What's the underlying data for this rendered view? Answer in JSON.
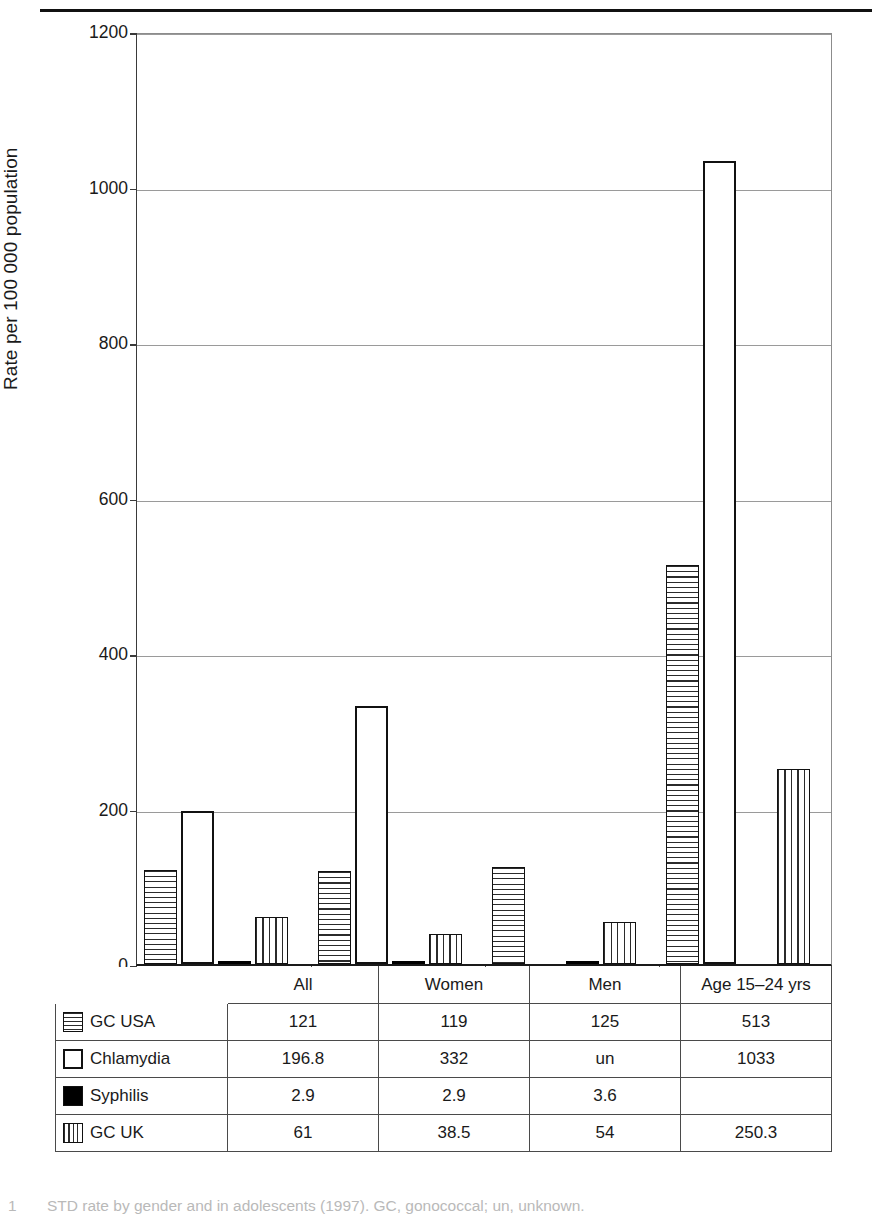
{
  "figure": {
    "y_axis_title": "Rate per 100 000 population",
    "caption_number": "1",
    "caption_text": "STD rate by gender and in adolescents (1997). GC, gonococcal; un, unknown."
  },
  "chart_data": {
    "type": "bar",
    "title": "",
    "xlabel": "",
    "ylabel": "Rate per 100 000 population",
    "ylim": [
      0,
      1200
    ],
    "yticks": [
      0,
      200,
      400,
      600,
      800,
      1000,
      1200
    ],
    "ytick_labels": [
      "0",
      "200",
      "400",
      "600",
      "800",
      "1000",
      "1200"
    ],
    "grid": true,
    "legend_position": "table-below",
    "categories": [
      "All",
      "Women",
      "Men",
      "Age 15–24 yrs"
    ],
    "series": [
      {
        "name": "GC  USA",
        "pattern": "pat-horiz",
        "values": [
          121,
          119,
          125,
          513
        ],
        "labels": [
          "121",
          "119",
          "125",
          "513"
        ]
      },
      {
        "name": "Chlamydia",
        "pattern": "pat-open",
        "values": [
          196.8,
          332,
          null,
          1033
        ],
        "labels": [
          "196.8",
          "332",
          "un",
          "1033"
        ]
      },
      {
        "name": "Syphilis",
        "pattern": "pat-solid",
        "values": [
          2.9,
          2.9,
          3.6,
          null
        ],
        "labels": [
          "2.9",
          "2.9",
          "3.6",
          ""
        ]
      },
      {
        "name": "GC  UK",
        "pattern": "pat-vert",
        "values": [
          61,
          38.5,
          54,
          250.3
        ],
        "labels": [
          "61",
          "38.5",
          "54",
          "250.3"
        ]
      }
    ]
  },
  "table": {
    "corner_label": "",
    "column_headers": [
      "All",
      "Women",
      "Men",
      "Age 15–24 yrs"
    ],
    "rows": [
      {
        "label": "GC  USA",
        "swatch": "pat-horiz",
        "cells": [
          "121",
          "119",
          "125",
          "513"
        ]
      },
      {
        "label": "Chlamydia",
        "swatch": "pat-open",
        "cells": [
          "196.8",
          "332",
          "un",
          "1033"
        ]
      },
      {
        "label": "Syphilis",
        "swatch": "pat-solid",
        "cells": [
          "2.9",
          "2.9",
          "3.6",
          ""
        ]
      },
      {
        "label": "GC  UK",
        "swatch": "pat-vert",
        "cells": [
          "61",
          "38.5",
          "54",
          "250.3"
        ]
      }
    ]
  },
  "colors": {
    "ink": "#1a1a1a",
    "grid": "#9a9a9a",
    "axis": "#1a1a1a",
    "caption": "#b9b9b9"
  }
}
